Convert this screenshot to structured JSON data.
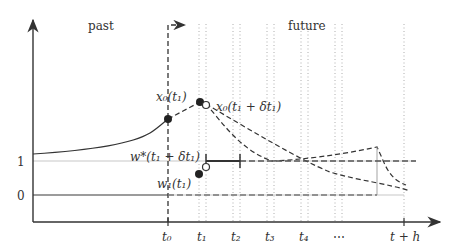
{
  "diagram": {
    "region_labels": {
      "past": "past",
      "future": "future"
    },
    "y_ticks": [
      {
        "label": "1",
        "y": 161
      },
      {
        "label": "0",
        "y": 195
      }
    ],
    "x_ticks": [
      {
        "label": "t₀",
        "x": 168
      },
      {
        "label": "t₁",
        "x": 203
      },
      {
        "label": "t₂",
        "x": 237
      },
      {
        "label": "t₃",
        "x": 271
      },
      {
        "label": "t₄",
        "x": 305
      },
      {
        "label": "⋯",
        "x": 339
      },
      {
        "label": "t + h",
        "x": 406
      }
    ],
    "point_labels": {
      "x0_t1": "x₀(t₁)",
      "x0_t1_dt": "x₀(t₁ + δt₁)",
      "w_star": "w*(t₁ + δt₁)",
      "w_t1": "w₁(t₁)"
    },
    "colors": {
      "ink": "#333333",
      "grid": "#bbbbbb",
      "ref_line": "#c8c8c8"
    }
  }
}
